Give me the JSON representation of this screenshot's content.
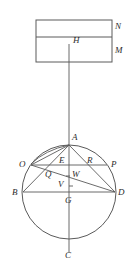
{
  "figure": {
    "stroke_color": "#5a5a5a",
    "label_color": "#2b2b2b",
    "background": "#ffffff",
    "rectangle": {
      "x": 36,
      "y": 20,
      "width": 76,
      "height": 42,
      "divider_y": 37,
      "labels": {
        "upper_region": "N",
        "lower_region": "M",
        "inner_point": "H"
      }
    },
    "circle": {
      "cx": 69,
      "cy": 192,
      "r": 47
    },
    "points": [
      {
        "name": "A",
        "label": "A",
        "x": 69,
        "y": 145,
        "label_x": 72,
        "label_y": 133
      },
      {
        "name": "B",
        "label": "B",
        "x": 23,
        "y": 192,
        "label_x": 12,
        "label_y": 188
      },
      {
        "name": "C",
        "label": "C",
        "x": 69,
        "y": 239,
        "label_x": 65,
        "label_y": 251
      },
      {
        "name": "D",
        "label": "D",
        "x": 115,
        "y": 192,
        "label_x": 118,
        "label_y": 188
      },
      {
        "name": "O",
        "label": "O",
        "x": 31,
        "y": 165,
        "label_x": 19,
        "label_y": 160
      },
      {
        "name": "P",
        "label": "P",
        "x": 107,
        "y": 165,
        "label_x": 111,
        "label_y": 160
      },
      {
        "name": "E",
        "label": "E",
        "x": 69,
        "y": 165,
        "label_x": 59,
        "label_y": 156
      },
      {
        "name": "R",
        "label": "R",
        "x": 90,
        "y": 165,
        "label_x": 87,
        "label_y": 156
      },
      {
        "name": "Q",
        "label": "Q",
        "x": 52,
        "y": 176,
        "label_x": 45,
        "label_y": 170
      },
      {
        "name": "W",
        "label": "W",
        "x": 69,
        "y": 176,
        "label_x": 72,
        "label_y": 170
      },
      {
        "name": "V",
        "label": "V",
        "x": 69,
        "y": 186,
        "label_x": 58,
        "label_y": 180
      },
      {
        "name": "G",
        "label": "G",
        "x": 69,
        "y": 192,
        "label_x": 65,
        "label_y": 196
      },
      {
        "name": "H",
        "label": "H",
        "x": 69,
        "y": 44,
        "label_x": 73,
        "label_y": 36
      },
      {
        "name": "N",
        "label": "N",
        "x": 118,
        "y": 26,
        "label_x": 115,
        "label_y": 22
      },
      {
        "name": "M",
        "label": "M",
        "x": 118,
        "y": 50,
        "label_x": 115,
        "label_y": 46
      }
    ],
    "segments": [
      {
        "name": "vertical-axis-H-to-C",
        "x1": 69,
        "y1": 44,
        "x2": 69,
        "y2": 253
      },
      {
        "name": "chord-O-to-P",
        "x1": 31,
        "y1": 165,
        "x2": 107,
        "y2": 165
      },
      {
        "name": "diameter-B-to-D",
        "x1": 23,
        "y1": 192,
        "x2": 115,
        "y2": 192
      },
      {
        "name": "line-A-to-O",
        "x1": 69,
        "y1": 145,
        "x2": 31,
        "y2": 165
      },
      {
        "name": "line-A-to-B",
        "x1": 69,
        "y1": 145,
        "x2": 23,
        "y2": 192
      },
      {
        "name": "line-A-to-D",
        "x1": 69,
        "y1": 145,
        "x2": 115,
        "y2": 192
      },
      {
        "name": "line-O-to-D",
        "x1": 31,
        "y1": 165,
        "x2": 115,
        "y2": 192
      }
    ],
    "arcs": [
      {
        "name": "arc-A-to-O",
        "d": "M 69 145 Q 45 150 31 164"
      }
    ],
    "ticks": [
      {
        "name": "tick-W",
        "x1": 66,
        "y1": 176,
        "x2": 70,
        "y2": 176
      },
      {
        "name": "tick-V",
        "x1": 69,
        "y1": 186,
        "x2": 73,
        "y2": 186
      }
    ]
  }
}
